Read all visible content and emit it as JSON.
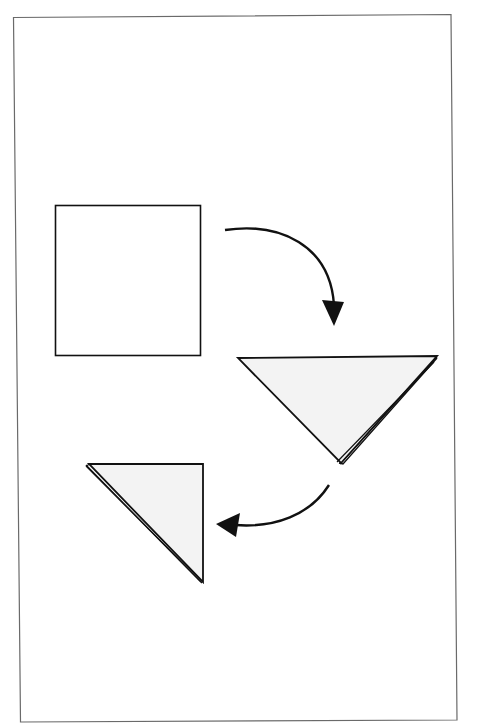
{
  "diagram": {
    "colors": {
      "background": "#ffffff",
      "frame": "#6a6a6a",
      "stroke": "#111111",
      "fill_paper": "#ffffff",
      "fill_folded": "#f3f3f3"
    },
    "steps": [
      {
        "id": "step-1",
        "shape": "square",
        "label": "Unfolded square paper"
      },
      {
        "id": "step-2",
        "shape": "triangle-down",
        "label": "Folded in half diagonally"
      },
      {
        "id": "step-3",
        "shape": "triangle-right",
        "label": "Folded in half again"
      }
    ],
    "arrows": [
      {
        "id": "arrow-1",
        "from": "step-1",
        "to": "step-2",
        "icon": "curved-arrow-down-icon"
      },
      {
        "id": "arrow-2",
        "from": "step-2",
        "to": "step-3",
        "icon": "curved-arrow-left-icon"
      }
    ]
  }
}
